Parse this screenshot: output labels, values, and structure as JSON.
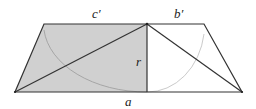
{
  "diagram": {
    "type": "trapezoid-geometry",
    "labels": {
      "top_left_segment": "c′",
      "top_right_segment": "b′",
      "height": "r",
      "base": "a"
    },
    "colors": {
      "shaded_region": "#d0d0d0",
      "stroke": "#333333",
      "arc": "#9a9a9a",
      "background": "#ffffff"
    },
    "points": {
      "top_left": [
        44,
        24
      ],
      "top_mid": [
        147,
        24
      ],
      "top_right": [
        204,
        24
      ],
      "bottom_left": [
        15,
        92
      ],
      "bottom_mid": [
        147,
        92
      ],
      "bottom_right": [
        242,
        92
      ]
    }
  }
}
